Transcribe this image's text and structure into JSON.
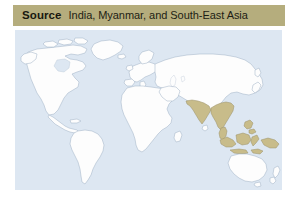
{
  "figure": {
    "name": "world-map-source-figure",
    "page_background": "#ffffff"
  },
  "source_bar": {
    "label": "Source",
    "text": "India, Myanmar, and South-East Asia",
    "background_color": "#b5ad7d",
    "text_color": "#181810"
  },
  "map": {
    "ocean_color": "#dde7f2",
    "land_color": "#fdfdfd",
    "land_outline_color": "#9fb0c4",
    "highlight_color": "#c8bc8a",
    "highlight_outline_color": "#9a9068",
    "projection": "world",
    "highlighted_regions": [
      "India",
      "Myanmar",
      "South-East Asia",
      "Indonesian archipelago"
    ],
    "regions": [
      {
        "name": "North America",
        "highlighted": false
      },
      {
        "name": "South America",
        "highlighted": false
      },
      {
        "name": "Greenland",
        "highlighted": false
      },
      {
        "name": "Europe",
        "highlighted": false
      },
      {
        "name": "Africa",
        "highlighted": false
      },
      {
        "name": "Asia",
        "highlighted": false
      },
      {
        "name": "India",
        "highlighted": true
      },
      {
        "name": "South-East Asia",
        "highlighted": true
      },
      {
        "name": "Indonesia",
        "highlighted": true
      },
      {
        "name": "New Guinea",
        "highlighted": true
      },
      {
        "name": "Philippines",
        "highlighted": true
      },
      {
        "name": "Australia",
        "highlighted": false
      },
      {
        "name": "New Zealand",
        "highlighted": false
      }
    ]
  }
}
